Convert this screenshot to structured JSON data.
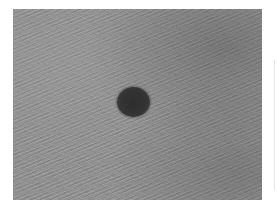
{
  "image": {
    "description": "Grayscale close-up photograph of skin with a single dark round pigmented lesion (mole) near the center",
    "subject": "skin-lesion",
    "colors": {
      "skin_gray": "#8f8f8f",
      "lesion_dark": "#333333",
      "background": "#ffffff"
    },
    "lesion": {
      "center_x": 133,
      "center_y": 102,
      "width": 33,
      "height": 30
    }
  }
}
